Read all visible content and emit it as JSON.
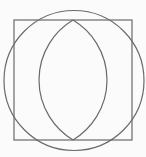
{
  "diagram": {
    "background": "#fbfbfb",
    "stroke_color": "#6a6a6a",
    "stroke_width": 1.2,
    "square": {
      "x": 14,
      "y": 20,
      "width": 118,
      "height": 120
    },
    "circle": {
      "cx": 74,
      "cy": 80.5,
      "r": 70
    },
    "vesica": {
      "top": {
        "x": 73,
        "y": 20
      },
      "bottom": {
        "x": 73,
        "y": 140
      },
      "left_extent_x": 39,
      "right_extent_x": 107
    }
  }
}
